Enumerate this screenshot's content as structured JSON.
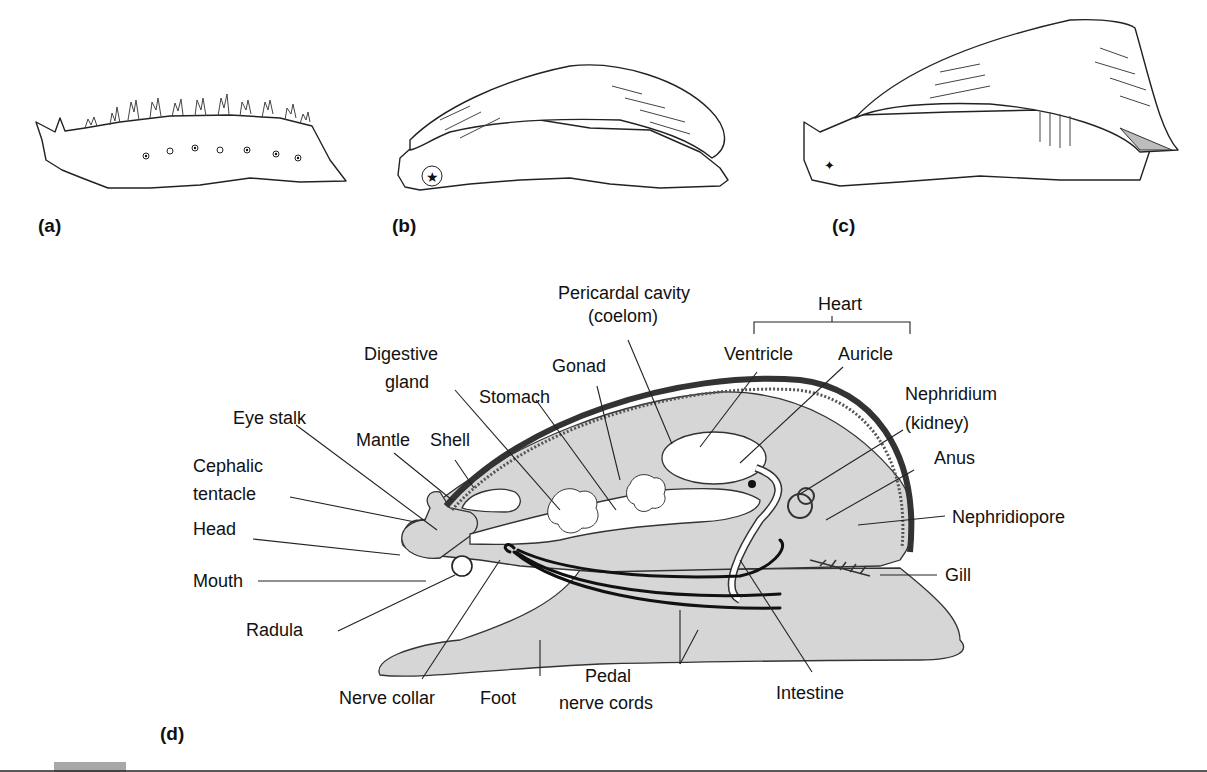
{
  "figure": {
    "panels": [
      {
        "id": "a",
        "label": "(a)"
      },
      {
        "id": "b",
        "label": "(b)"
      },
      {
        "id": "c",
        "label": "(c)"
      },
      {
        "id": "d",
        "label": "(d)"
      }
    ],
    "diagram_labels": {
      "pericardial_cavity_1": "Pericardal cavity",
      "pericardial_cavity_2": "(coelom)",
      "heart": "Heart",
      "ventricle": "Ventricle",
      "auricle": "Auricle",
      "digestive_gland_1": "Digestive",
      "digestive_gland_2": "gland",
      "gonad": "Gonad",
      "stomach": "Stomach",
      "nephridium_1": "Nephridium",
      "nephridium_2": "(kidney)",
      "eye_stalk": "Eye stalk",
      "mantle": "Mantle",
      "shell": "Shell",
      "anus": "Anus",
      "cephalic_tentacle_1": "Cephalic",
      "cephalic_tentacle_2": "tentacle",
      "nephridiopore": "Nephridiopore",
      "head": "Head",
      "mouth": "Mouth",
      "gill": "Gill",
      "radula": "Radula",
      "nerve_collar": "Nerve collar",
      "foot": "Foot",
      "pedal_nerve_cords_1": "Pedal",
      "pedal_nerve_cords_2": "nerve cords",
      "intestine": "Intestine"
    },
    "colors": {
      "tissue_fill": "#d6d6d6",
      "shell_dark": "#333333",
      "outline": "#222222",
      "background": "#ffffff",
      "footer_tab": "#a8a8a8"
    }
  }
}
